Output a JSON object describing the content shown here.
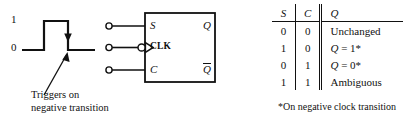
{
  "figure": {
    "background_color": "#ffffff",
    "ink_color": "#111111"
  },
  "waveform": {
    "high_label": "1",
    "low_label": "0",
    "caption_line1": "Triggers on",
    "caption_line2": "negative transition",
    "annotation_marker": "down-arrow-on-falling-edge"
  },
  "flipflop": {
    "inputs": [
      {
        "name": "S",
        "label": "S"
      },
      {
        "name": "CLK",
        "label": "CLK",
        "inverted": true,
        "dynamic": true
      },
      {
        "name": "C",
        "label": "C"
      }
    ],
    "outputs": [
      {
        "name": "Q",
        "label": "Q"
      },
      {
        "name": "Qbar",
        "label": "Q",
        "overbar": true
      }
    ]
  },
  "truth_table": {
    "headers": [
      "S",
      "C",
      "Q"
    ],
    "rows": [
      {
        "s": "0",
        "c": "0",
        "q_prefix": "",
        "q_text": "Unchanged"
      },
      {
        "s": "1",
        "c": "0",
        "q_prefix": "Q",
        "q_text": " = 1*"
      },
      {
        "s": "0",
        "c": "1",
        "q_prefix": "Q",
        "q_text": " = 0*"
      },
      {
        "s": "1",
        "c": "1",
        "q_prefix": "",
        "q_text": "Ambiguous"
      }
    ],
    "footnote": "*On negative clock transition"
  }
}
